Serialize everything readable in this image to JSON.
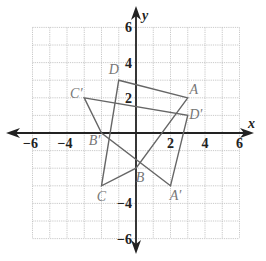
{
  "diagram": {
    "type": "coordinate-plane-transformation",
    "axes": {
      "x_label": "x",
      "y_label": "y",
      "x_ticks": [
        "−6",
        "−4",
        "2",
        "4",
        "6"
      ],
      "y_ticks": [
        "6",
        "4",
        "2",
        "−4",
        "−6"
      ],
      "range": [
        -6,
        6
      ],
      "grid_step": 1
    },
    "colors": {
      "axis": "#222222",
      "grid": "#bbbbbb",
      "figure": "#666666",
      "labels": "#777777"
    },
    "original": {
      "name": "ABCD",
      "vertices": [
        {
          "label": "A",
          "x": 3,
          "y": 2
        },
        {
          "label": "B",
          "x": 0,
          "y": -2
        },
        {
          "label": "C",
          "x": -2,
          "y": -3
        },
        {
          "label": "D",
          "x": -1,
          "y": 3
        }
      ]
    },
    "image": {
      "name": "A'B'C'D'",
      "vertices": [
        {
          "label": "A′",
          "x": 2,
          "y": -3
        },
        {
          "label": "B′",
          "x": -2,
          "y": 0
        },
        {
          "label": "C′",
          "x": -3,
          "y": 2
        },
        {
          "label": "D′",
          "x": 3,
          "y": 1
        }
      ]
    }
  }
}
